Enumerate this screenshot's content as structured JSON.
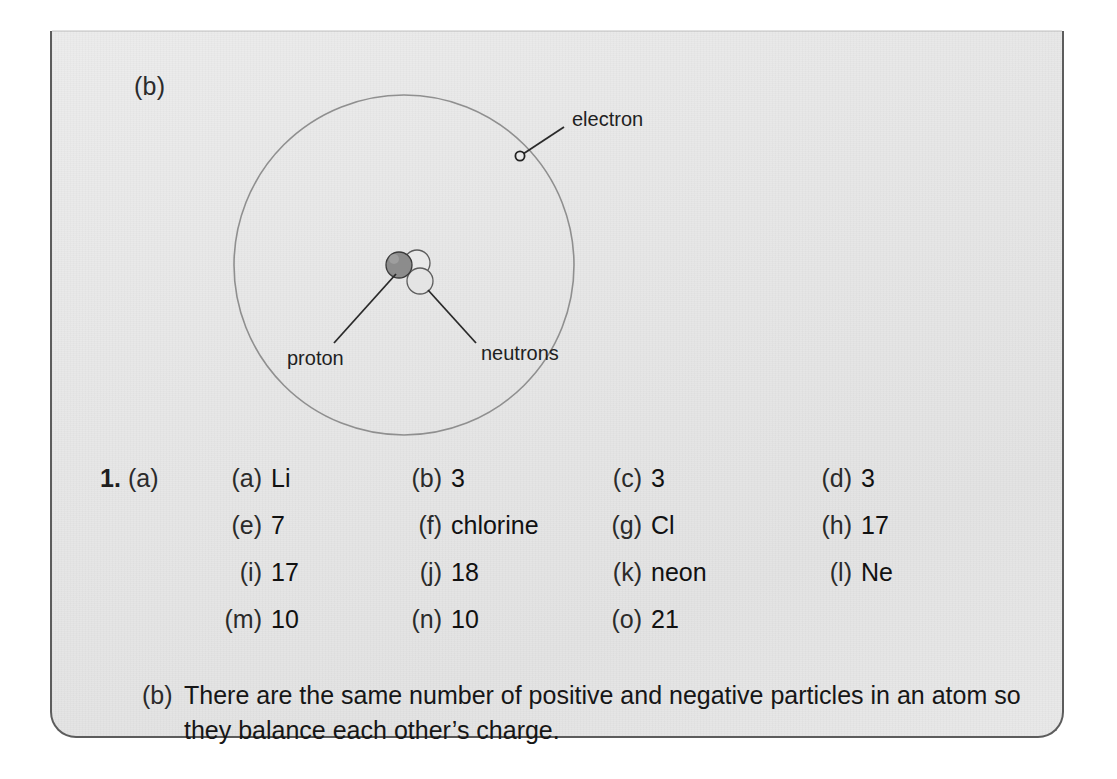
{
  "panel": {
    "part_label": "(b)",
    "border_color": "#5c5c5c",
    "background_color": "#e8e8e8"
  },
  "diagram": {
    "type": "bohr-atom-model",
    "labels": {
      "electron": "electron",
      "proton": "proton",
      "neutrons": "neutrons"
    },
    "particles": {
      "proton_count": 1,
      "neutron_count": 2,
      "electron_count": 1,
      "proton_color": "#8c8c8c",
      "neutron_color": "#e4e4e4",
      "orbit_color": "#8f8f8f"
    }
  },
  "answers": {
    "question_number": "1.",
    "question_part": "(a)",
    "rows": [
      [
        {
          "tag": "(a)",
          "value": "Li"
        },
        {
          "tag": "(b)",
          "value": "3"
        },
        {
          "tag": "(c)",
          "value": "3"
        },
        {
          "tag": "(d)",
          "value": "3"
        }
      ],
      [
        {
          "tag": "(e)",
          "value": "7"
        },
        {
          "tag": "(f)",
          "value": "chlorine"
        },
        {
          "tag": "(g)",
          "value": "Cl"
        },
        {
          "tag": "(h)",
          "value": "17"
        }
      ],
      [
        {
          "tag": "(i)",
          "value": "17"
        },
        {
          "tag": "(j)",
          "value": "18"
        },
        {
          "tag": "(k)",
          "value": "neon"
        },
        {
          "tag": "(l)",
          "value": "Ne"
        }
      ],
      [
        {
          "tag": "(m)",
          "value": "10"
        },
        {
          "tag": "(n)",
          "value": "10"
        },
        {
          "tag": "(o)",
          "value": "21"
        }
      ]
    ]
  },
  "closing": {
    "tag": "(b)",
    "text": "There are the same number of positive and negative particles in an atom so they balance each other’s charge."
  }
}
